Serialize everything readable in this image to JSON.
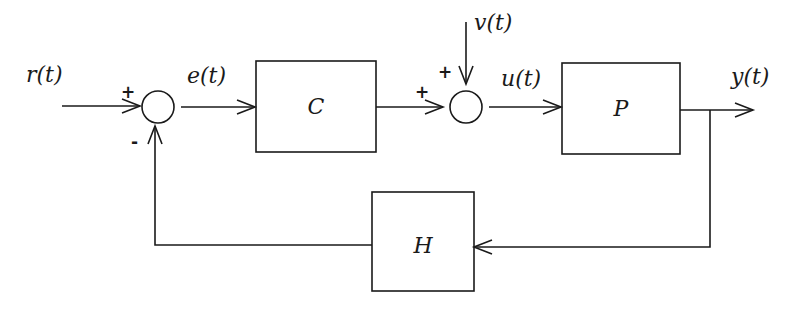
{
  "diagram": {
    "blocks": {
      "controller": "C",
      "plant": "P",
      "feedback": "H"
    },
    "signals": {
      "reference": "r(t)",
      "error": "e(t)",
      "disturbance": "v(t)",
      "control": "u(t)",
      "output": "y(t)"
    },
    "summing_junctions": {
      "error_junction": {
        "plus": "+",
        "minus": "-"
      },
      "disturbance_junction": {
        "plus_left": "+",
        "plus_top": "+"
      }
    },
    "colors": {
      "stroke": "#1a1a1a",
      "background": "#ffffff"
    }
  }
}
